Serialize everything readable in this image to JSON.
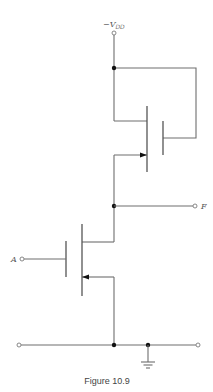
{
  "diagram": {
    "type": "circuit-schematic",
    "supply_label": {
      "prefix": "−V",
      "subscript": "DD"
    },
    "input_label": "A",
    "output_label": "F",
    "caption": "Figure 10.9",
    "components": [
      {
        "id": "load-transistor",
        "kind": "MOSFET",
        "role": "load",
        "gate": "tied to V_DD node"
      },
      {
        "id": "driver-transistor",
        "kind": "MOSFET",
        "role": "driver",
        "gate": "input A"
      },
      {
        "id": "ground",
        "kind": "ground-symbol"
      }
    ],
    "nodes": [
      "-V_DD",
      "F (output)",
      "A (input)",
      "ground rail"
    ]
  }
}
